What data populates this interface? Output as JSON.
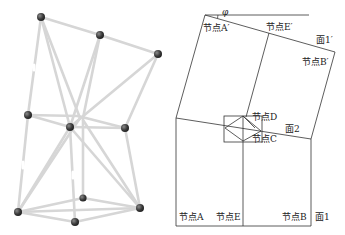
{
  "figure": {
    "left_panel": {
      "description": "3D stick-and-ball truss model",
      "nodes": [
        {
          "id": "n1",
          "x": 41,
          "y": 17
        },
        {
          "id": "n2",
          "x": 100,
          "y": 35
        },
        {
          "id": "n3",
          "x": 158,
          "y": 54
        },
        {
          "id": "n4",
          "x": 28,
          "y": 115
        },
        {
          "id": "n5",
          "x": 70,
          "y": 127
        },
        {
          "id": "n6",
          "x": 125,
          "y": 128
        },
        {
          "id": "n7",
          "x": 83,
          "y": 198
        },
        {
          "id": "n8",
          "x": 18,
          "y": 212
        },
        {
          "id": "n9",
          "x": 140,
          "y": 208
        },
        {
          "id": "n10",
          "x": 75,
          "y": 222
        }
      ],
      "node_color": "#3a3a3a",
      "bar_color": "#c8c8c8"
    },
    "right_panel": {
      "labels": {
        "angle": "φ",
        "node_a_prime": "节点A′",
        "node_e_prime": "节点E′",
        "face_1_prime": "面1′",
        "node_b_prime": "节点B′",
        "node_d": "节点D",
        "face_2": "面2",
        "node_c": "节点C",
        "node_a": "节点A",
        "node_e": "节点E",
        "node_b": "节点B",
        "face_1": "面1"
      },
      "line_color": "#333333"
    }
  }
}
